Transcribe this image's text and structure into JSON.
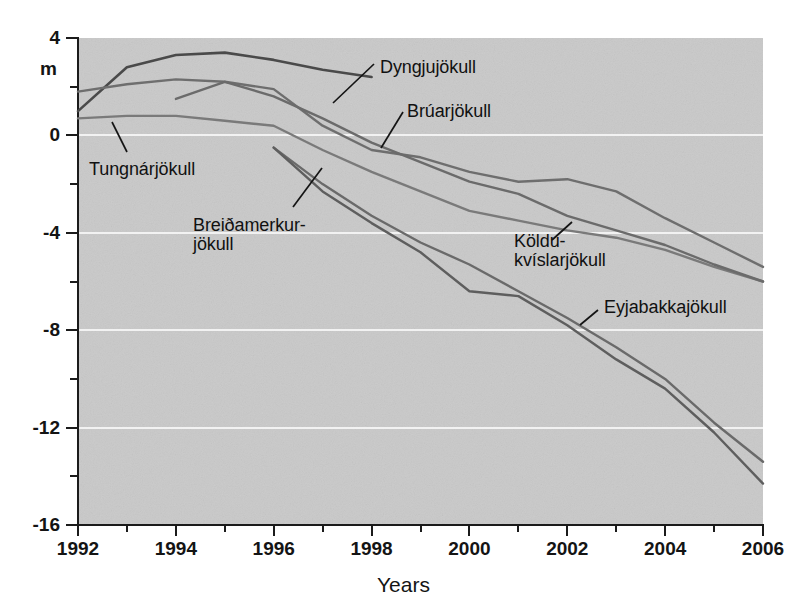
{
  "chart_data": {
    "type": "line",
    "title": "",
    "subtitle": "",
    "xlabel": "Years",
    "ylabel": "m",
    "xlim": [
      1992,
      2006
    ],
    "ylim": [
      -16,
      4
    ],
    "grid": "horizontal-major-only",
    "legend": "inline-annotations",
    "background": "#c9c9c9",
    "y_major_ticks": [
      4,
      0,
      -4,
      -8,
      -12,
      -16
    ],
    "y_minor_ticks": [
      2,
      -2,
      -6,
      -10,
      -14
    ],
    "x_major_ticks": [
      1992,
      1994,
      1996,
      1998,
      2000,
      2002,
      2004,
      2006
    ],
    "x_minor_ticks": [
      1993,
      1995,
      1997,
      1999,
      2001,
      2003,
      2005
    ],
    "y_tick_labels": [
      "4",
      "0",
      "-4",
      "-8",
      "-12",
      "-16"
    ],
    "x_tick_labels": [
      "1992",
      "1994",
      "1996",
      "1998",
      "2000",
      "2002",
      "2004",
      "2006"
    ],
    "series": [
      {
        "name": "Dyngjujökull",
        "color": "#4a4a4a",
        "width": 2.6,
        "x": [
          1992,
          1993,
          1994,
          1995,
          1996,
          1997,
          1998
        ],
        "values": [
          1.0,
          2.8,
          3.3,
          3.4,
          3.1,
          2.7,
          2.4
        ]
      },
      {
        "name": "Brúarjökull",
        "color": "#6e6e6e",
        "width": 2.4,
        "x": [
          1992,
          1993,
          1994,
          1995,
          1996,
          1997,
          1998,
          1999,
          2000,
          2001,
          2002,
          2003,
          2004,
          2005,
          2006
        ],
        "values": [
          1.8,
          2.1,
          2.3,
          2.2,
          1.9,
          0.4,
          -0.6,
          -0.9,
          -1.5,
          -1.9,
          -1.8,
          -2.3,
          -3.4,
          -4.4,
          -5.4
        ]
      },
      {
        "name": "Tungnárjökull",
        "color": "#7a7a7a",
        "width": 2.4,
        "x": [
          1992,
          1993,
          1994,
          1995,
          1996,
          1997,
          1998,
          1999,
          2000,
          2001,
          2002,
          2003,
          2004,
          2005,
          2006
        ],
        "values": [
          0.7,
          0.8,
          0.8,
          0.6,
          0.4,
          -0.6,
          -1.5,
          -2.3,
          -3.1,
          -3.5,
          -3.9,
          -4.2,
          -4.7,
          -5.4,
          -6.0
        ]
      },
      {
        "name": "Köldukvíslarjökull",
        "color": "#6b6b6b",
        "width": 2.4,
        "x": [
          1994,
          1995,
          1996,
          1997,
          1998,
          1999,
          2000,
          2001,
          2002,
          2003,
          2004,
          2005,
          2006
        ],
        "values": [
          1.5,
          2.2,
          1.6,
          0.7,
          -0.3,
          -1.1,
          -1.9,
          -2.4,
          -3.3,
          -3.9,
          -4.5,
          -5.3,
          -6.0
        ]
      },
      {
        "name": "Breiðamerkurjökull",
        "color": "#6a6a6a",
        "width": 2.4,
        "x": [
          1996,
          1997,
          1998,
          1999,
          2000,
          2001,
          2002,
          2003,
          2004,
          2005,
          2006
        ],
        "values": [
          -0.5,
          -2.0,
          -3.3,
          -4.4,
          -5.3,
          -6.4,
          -7.5,
          -8.7,
          -10.0,
          -11.8,
          -13.4
        ]
      },
      {
        "name": "Eyjabakkajökull",
        "color": "#5e5e5e",
        "width": 2.4,
        "x": [
          1996,
          1997,
          1998,
          1999,
          2000,
          2001,
          2002,
          2003,
          2004,
          2005,
          2006
        ],
        "values": [
          -0.5,
          -2.3,
          -3.6,
          -4.8,
          -6.4,
          -6.6,
          -7.8,
          -9.2,
          -10.4,
          -12.2,
          -14.3
        ]
      }
    ],
    "annotations": [
      {
        "label": "Dyngjujökull",
        "x_px": 380,
        "y_px": 58
      },
      {
        "label": "Brúarjökull",
        "x_px": 407,
        "y_px": 102
      },
      {
        "label": "Tungnárjökull",
        "x_px": 89,
        "y_px": 160
      },
      {
        "label": "Breiðamerkur-\njökull",
        "x_px": 193,
        "y_px": 216
      },
      {
        "label": "Köldu-\nkvíslarjökull",
        "x_px": 514,
        "y_px": 232
      },
      {
        "label": "Eyjabakkajökull",
        "x_px": 604,
        "y_px": 298
      }
    ]
  },
  "axis": {
    "y_unit": "m",
    "x_title": "Years"
  }
}
